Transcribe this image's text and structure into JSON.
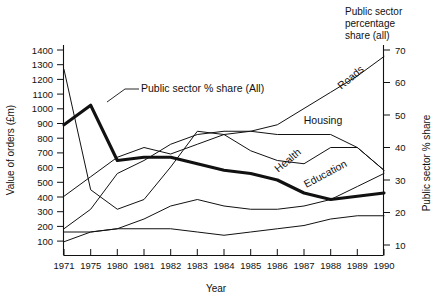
{
  "chart_data": {
    "type": "line",
    "title": "",
    "xlabel": "Year",
    "ylabel": "Value of orders (£m)",
    "y2label": "Public sector % share",
    "corner_note": "Public sector\npercentage\nshare (all)",
    "categories": [
      "1971",
      "1975",
      "1980",
      "1981",
      "1982",
      "1983",
      "1984",
      "1985",
      "1986",
      "1987",
      "1988",
      "1989",
      "1990"
    ],
    "x_tick_labels": [
      "1971",
      "1975",
      "1980",
      "1981",
      "1982",
      "1983",
      "1984",
      "1985",
      "1986",
      "1987",
      "1988",
      "1989",
      "1990"
    ],
    "ylim": [
      0,
      1450
    ],
    "y_tick_labels": [
      "100",
      "200",
      "300",
      "400",
      "500",
      "600",
      "700",
      "800",
      "900",
      "1000",
      "1100",
      "1200",
      "1300",
      "1400"
    ],
    "y_ticks": [
      100,
      200,
      300,
      400,
      500,
      600,
      700,
      800,
      900,
      1000,
      1100,
      1200,
      1300,
      1400
    ],
    "y2lim": [
      0,
      72
    ],
    "y2_tick_labels": [
      "10",
      "20",
      "30",
      "40",
      "50",
      "60",
      "70"
    ],
    "y2_ticks": [
      10,
      20,
      30,
      40,
      50,
      60,
      70
    ],
    "grid": false,
    "legend": "inline-annotations",
    "series": [
      {
        "name": "Public sector % share (All)",
        "axis": "right",
        "style": "thick",
        "label_kind": "callout",
        "values": [
          47,
          53,
          36,
          37,
          37,
          35,
          33,
          32,
          30,
          26,
          24,
          25,
          26
        ]
      },
      {
        "name": "Roads",
        "axis": "right",
        "style": "thin",
        "label_kind": "inline",
        "values": [
          25,
          31,
          37,
          40,
          38,
          41,
          44,
          45,
          47,
          52,
          57,
          62,
          68
        ]
      },
      {
        "name": "Housing",
        "axis": "right",
        "style": "thin",
        "label_kind": "inline",
        "values": [
          15,
          21,
          32,
          36,
          41,
          44,
          45,
          45,
          44,
          44,
          44,
          40,
          33
        ]
      },
      {
        "name": "Health",
        "axis": "right",
        "style": "thin",
        "label_kind": "inline",
        "values": [
          64,
          27,
          21,
          24,
          34,
          45,
          44,
          39,
          36,
          35,
          40,
          40,
          33
        ]
      },
      {
        "name": "Education",
        "axis": "right",
        "style": "thin",
        "label_kind": "inline",
        "values": [
          14,
          14,
          15,
          18,
          22,
          24,
          22,
          21,
          21,
          22,
          24,
          28,
          32
        ]
      },
      {
        "name": "Unlabelled lower series",
        "axis": "right",
        "style": "thin",
        "label_kind": "none",
        "values": [
          11,
          14,
          15,
          15,
          15,
          14,
          13,
          14,
          15,
          16,
          18,
          19,
          19
        ]
      }
    ],
    "annotations": [
      {
        "text": "Public sector % share (All)",
        "kind": "callout"
      },
      {
        "text": "Roads",
        "kind": "inline"
      },
      {
        "text": "Housing",
        "kind": "inline"
      },
      {
        "text": "Health",
        "kind": "inline"
      },
      {
        "text": "Education",
        "kind": "inline"
      }
    ]
  },
  "corner": {
    "line1": "Public sector",
    "line2": "percentage",
    "line3": "share (all)"
  },
  "axes": {
    "left_title": "Value of orders (£m)",
    "right_title": "Public sector % share",
    "x_title": "Year"
  },
  "labels": {
    "callout_public_sector": "Public sector % share (All)",
    "roads": "Roads",
    "housing": "Housing",
    "health": "Health",
    "education": "Education"
  },
  "y_ticks": {
    "t100": "100",
    "t200": "200",
    "t300": "300",
    "t400": "400",
    "t500": "500",
    "t600": "600",
    "t700": "700",
    "t800": "800",
    "t900": "900",
    "t1000": "1000",
    "t1100": "1100",
    "t1200": "1200",
    "t1300": "1300",
    "t1400": "1400"
  },
  "y2_ticks": {
    "r10": "10",
    "r20": "20",
    "r30": "30",
    "r40": "40",
    "r50": "50",
    "r60": "60",
    "r70": "70"
  },
  "x_ticks": {
    "x1971": "1971",
    "x1975": "1975",
    "x1980": "1980",
    "x1981": "1981",
    "x1982": "1982",
    "x1983": "1983",
    "x1984": "1984",
    "x1985": "1985",
    "x1986": "1986",
    "x1987": "1987",
    "x1988": "1988",
    "x1989": "1989",
    "x1990": "1990"
  }
}
